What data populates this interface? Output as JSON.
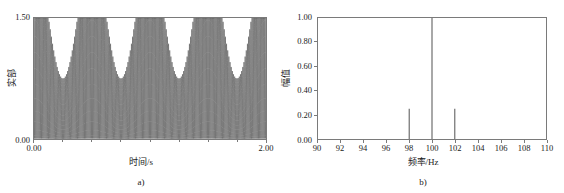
{
  "figure": {
    "panels": [
      {
        "caption": "a)",
        "xlabel": "时间/s",
        "ylabel": "实部",
        "xticks": [
          "0.00",
          "2.00"
        ],
        "yticks": [
          "0.00",
          "1.50"
        ],
        "line_color": "#4a4a4a",
        "frame_color": "#7a7a7a"
      },
      {
        "caption": "b)",
        "xlabel": "频率/Hz",
        "ylabel": "幅值",
        "xticks": [
          "90",
          "92",
          "94",
          "96",
          "98",
          "100",
          "102",
          "104",
          "106",
          "108",
          "110"
        ],
        "yticks": [
          "0.00",
          "0.20",
          "0.40",
          "0.60",
          "0.80",
          "1.00"
        ],
        "line_color": "#3c3c3c",
        "frame_color": "#7a7a7a"
      }
    ]
  },
  "chart_data": [
    {
      "type": "line",
      "title": "",
      "subtitle": "",
      "xlabel": "时间/s",
      "ylabel": "实部",
      "xlim": [
        0.0,
        2.0
      ],
      "ylim": [
        0.0,
        1.5
      ],
      "xticks": [
        0.0,
        2.0
      ],
      "xticklabels": [
        "0.00",
        "2.00"
      ],
      "yticks": [
        0.0,
        1.5
      ],
      "yticklabels": [
        "0.00",
        "1.50"
      ],
      "grid": false,
      "legend": "none",
      "annotation": "a)",
      "description": "Amplitude-modulated real-valued time signal: 100 Hz carrier modulated by a 2 Hz envelope, DC-offset so the trace spans 0.00 to 1.50.",
      "signal_model": {
        "carrier_hz": 100,
        "modulation_hz": 2,
        "offset": 0.75,
        "carrier_amplitude": 0.75,
        "modulation_depth": 0.5,
        "duration_s": 2.0,
        "envelope_max": 1.5,
        "envelope_min": 0.0,
        "envelope_beats": 4
      }
    },
    {
      "type": "bar",
      "title": "",
      "subtitle": "",
      "xlabel": "频率/Hz",
      "ylabel": "幅值",
      "xlim": [
        90,
        110
      ],
      "ylim": [
        0.0,
        1.0
      ],
      "xticks": [
        90,
        92,
        94,
        96,
        98,
        100,
        102,
        104,
        106,
        108,
        110
      ],
      "xticklabels": [
        "90",
        "92",
        "94",
        "96",
        "98",
        "100",
        "102",
        "104",
        "106",
        "108",
        "110"
      ],
      "yticks": [
        0.0,
        0.2,
        0.4,
        0.6,
        0.8,
        1.0
      ],
      "yticklabels": [
        "0.00",
        "0.20",
        "0.40",
        "0.60",
        "0.80",
        "1.00"
      ],
      "grid": false,
      "legend": "none",
      "annotation": "b)",
      "categories": [
        98,
        100,
        102
      ],
      "values": [
        0.25,
        1.0,
        0.25
      ],
      "description": "Line spectrum of the signal in a): a dominant carrier line at 100 Hz with amplitude 1.00 and two sidebands at 98 Hz and 102 Hz each with amplitude 0.25."
    }
  ]
}
